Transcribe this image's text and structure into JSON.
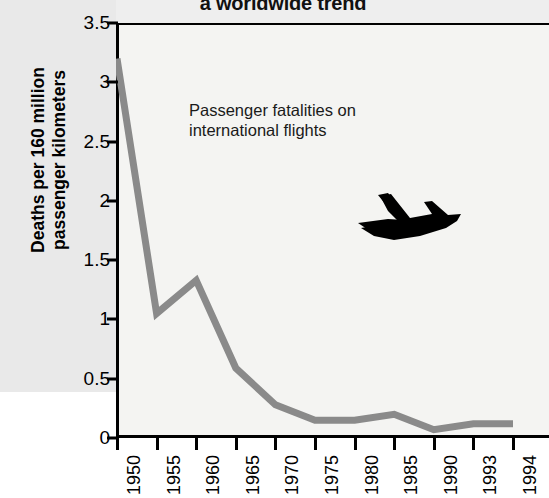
{
  "title": "a worldwide trend",
  "axis": {
    "y_label_line1": "Deaths per 160 million",
    "y_label_line2": "passenger kilometers"
  },
  "annotation": {
    "line1": "Passenger fatalities on",
    "line2": "international flights"
  },
  "icons": {
    "airplane": "airplane-silhouette-icon"
  },
  "colors": {
    "line": "#8a8a8a",
    "axis": "#000000",
    "plot_background": "#f4f4f2",
    "plane": "#000000"
  },
  "chart_data": {
    "type": "line",
    "title": "a worldwide trend",
    "xlabel": "",
    "ylabel": "Deaths per 160 million passenger kilometers",
    "categories": [
      "1950",
      "1955",
      "1960",
      "1965",
      "1970",
      "1975",
      "1980",
      "1985",
      "1990",
      "1993",
      "1994"
    ],
    "values": [
      3.2,
      1.05,
      1.33,
      0.59,
      0.28,
      0.15,
      0.15,
      0.2,
      0.07,
      0.12,
      0.12
    ],
    "series": [
      {
        "name": "Passenger fatalities on international flights",
        "values": [
          3.2,
          1.05,
          1.33,
          0.59,
          0.28,
          0.15,
          0.15,
          0.2,
          0.07,
          0.12,
          0.12
        ]
      }
    ],
    "ylim": [
      0,
      3.5
    ],
    "yticks": [
      "0",
      "0.5",
      "1",
      "1.5",
      "2",
      "2.5",
      "3",
      "3.5"
    ],
    "ytick_values": [
      0,
      0.5,
      1,
      1.5,
      2,
      2.5,
      3,
      3.5
    ],
    "xticks": [
      "1950",
      "1955",
      "1960",
      "1965",
      "1970",
      "1975",
      "1980",
      "1985",
      "1990",
      "1993",
      "1994"
    ],
    "grid": false,
    "legend": "none",
    "annotations": [
      "Passenger fatalities on international flights"
    ]
  }
}
